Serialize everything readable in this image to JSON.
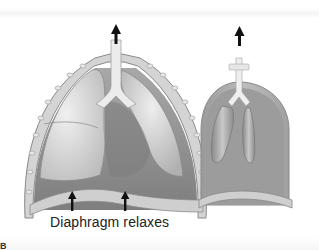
{
  "figure": {
    "caption": "Diaphragm relaxes",
    "panel_letter": "B",
    "left_model": {
      "name": "thorax-cross-section",
      "parts": [
        "trachea",
        "left-lung",
        "right-lung",
        "heart",
        "rib-cage-wall",
        "diaphragm"
      ],
      "airflow_arrow": "up",
      "diaphragm_arrows": 2
    },
    "right_model": {
      "name": "bell-jar-lung-model",
      "parts": [
        "tube",
        "y-connector",
        "balloon-left",
        "balloon-right",
        "bell-jar",
        "rubber-sheet"
      ],
      "airflow_arrow": "up"
    },
    "colors": {
      "cavity": "#8f8f8f",
      "lung": "#d8d8d8",
      "wall": "#b5b5b5",
      "arrow": "#111111",
      "background": "#ffffff"
    }
  }
}
